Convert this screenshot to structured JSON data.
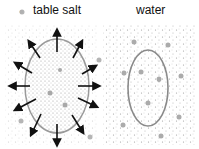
{
  "left_panel": {
    "label": "table salt",
    "legend_marker": "gray-dot"
  },
  "right_panel": {
    "label": "water"
  },
  "colors": {
    "arrow": "#111111",
    "ellipse_left": "#9a9a9a",
    "ellipse_right": "#8a8a8a",
    "dots": "#bdbdbd",
    "big_dots": "#b0b0b0"
  }
}
